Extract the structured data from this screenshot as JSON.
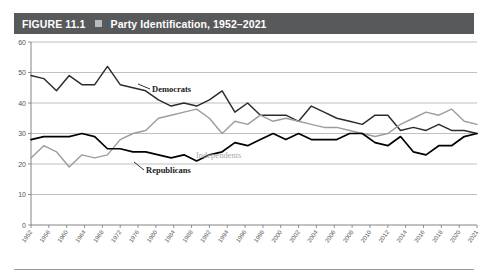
{
  "figure": {
    "label": "FIGURE 11.1",
    "marker_icon": "square-bullet-icon",
    "title": "Party Identification, 1952–2021"
  },
  "chart_data": {
    "type": "line",
    "title": "Party Identification, 1952–2021",
    "xlabel": "",
    "ylabel": "",
    "ylim": [
      0,
      60
    ],
    "yticks": [
      0,
      10,
      20,
      30,
      40,
      50,
      60
    ],
    "grid": true,
    "legend_position": "inline-annotations",
    "x": [
      1952,
      1954,
      1956,
      1958,
      1960,
      1962,
      1964,
      1966,
      1968,
      1970,
      1972,
      1974,
      1976,
      1978,
      1980,
      1982,
      1984,
      1986,
      1988,
      1990,
      1992,
      1994,
      1996,
      1998,
      2000,
      2002,
      2004,
      2006,
      2008,
      2010,
      2012,
      2014,
      2016,
      2018,
      2020,
      2021
    ],
    "xtick_labels": [
      "1952",
      "1956",
      "1960",
      "1964",
      "1968",
      "1972",
      "1976",
      "1980",
      "1984",
      "1988",
      "1992",
      "1994",
      "1996",
      "1998",
      "2000",
      "2002",
      "2004",
      "2006",
      "2008",
      "2010",
      "2012",
      "2014",
      "2016",
      "2018",
      "2020",
      "2021"
    ],
    "series": [
      {
        "name": "Democrats",
        "color": "#2b2b2b",
        "annotation": "Democrats",
        "values": [
          49,
          48,
          44,
          49,
          46,
          46,
          52,
          46,
          45,
          44,
          41,
          39,
          40,
          39,
          41,
          44,
          37,
          40,
          36,
          36,
          36,
          34,
          39,
          37,
          35,
          34,
          33,
          36,
          36,
          31,
          32,
          31,
          33,
          31,
          31,
          30
        ]
      },
      {
        "name": "Independents",
        "color": "#9d9d9d",
        "annotation": "Independents",
        "values": [
          22,
          26,
          24,
          19,
          23,
          22,
          23,
          28,
          30,
          31,
          35,
          36,
          37,
          38,
          35,
          30,
          34,
          33,
          36,
          34,
          35,
          34,
          33,
          32,
          32,
          31,
          30,
          29,
          30,
          33,
          35,
          37,
          36,
          38,
          34,
          33
        ]
      },
      {
        "name": "Republicans",
        "color": "#000000",
        "annotation": "Republicans",
        "values": [
          28,
          29,
          29,
          29,
          30,
          29,
          25,
          25,
          24,
          24,
          23,
          22,
          23,
          21,
          23,
          24,
          27,
          26,
          28,
          30,
          28,
          30,
          28,
          28,
          28,
          30,
          30,
          27,
          26,
          29,
          24,
          23,
          26,
          26,
          29,
          30
        ]
      }
    ]
  }
}
